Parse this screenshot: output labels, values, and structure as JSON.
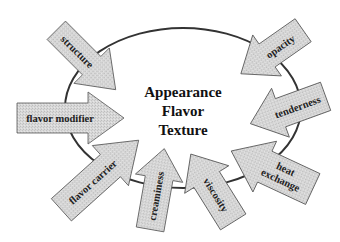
{
  "center": {
    "lines": [
      "Appearance",
      "Flavor",
      "Texture"
    ]
  },
  "colors": {
    "arrow_fill": "#d6d6d6",
    "arrow_stroke": "#555555",
    "ellipse_stroke": "#333333",
    "text": "#1a1a1a"
  },
  "arrows": [
    {
      "label": "structure"
    },
    {
      "label": "flavor modifier"
    },
    {
      "label": "flavor carrier"
    },
    {
      "label": "creaminess"
    },
    {
      "label": "viscosity"
    },
    {
      "label": "heat",
      "label2": "exchange"
    },
    {
      "label": "tenderness"
    },
    {
      "label": "opacity"
    }
  ]
}
